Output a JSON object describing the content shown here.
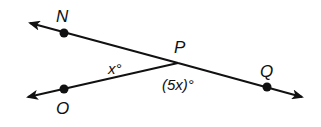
{
  "diagram": {
    "type": "geometry-angles",
    "colors": {
      "stroke": "#111111",
      "background": "#ffffff"
    },
    "points": [
      {
        "id": "N",
        "label": "N"
      },
      {
        "id": "P",
        "label": "P"
      },
      {
        "id": "Q",
        "label": "Q"
      },
      {
        "id": "O",
        "label": "O"
      }
    ],
    "angles": [
      {
        "between": "NPO",
        "label": "x°"
      },
      {
        "between": "OPQ",
        "label": "(5x)°"
      }
    ]
  }
}
